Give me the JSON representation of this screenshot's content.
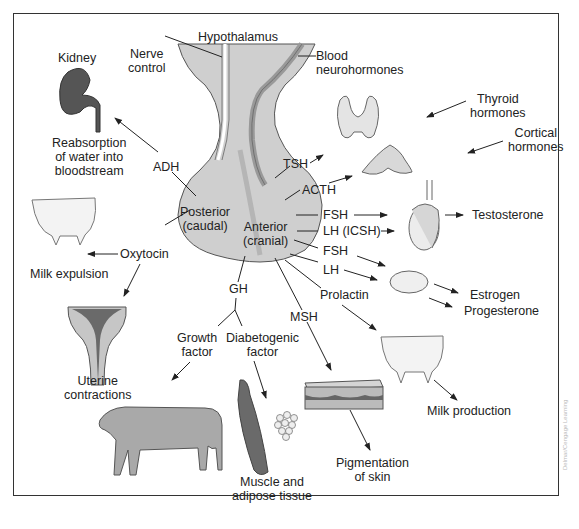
{
  "diagram": {
    "gland_regions": {
      "hypothalamus": "Hypothalamus",
      "nerve_control": [
        "Nerve",
        "control"
      ],
      "blood_neurohormones": [
        "Blood",
        "neurohormones"
      ],
      "posterior": [
        "Posterior",
        "(caudal)"
      ],
      "anterior": [
        "Anterior",
        "(cranial)"
      ]
    },
    "hormones": {
      "adh": "ADH",
      "oxytocin": "Oxytocin",
      "tsh": "TSH",
      "acth": "ACTH",
      "fsh_male": "FSH",
      "lh_icsh": "LH (ICSH)",
      "fsh_female": "FSH",
      "lh_female": "LH",
      "prolactin": "Prolactin",
      "msh": "MSH",
      "gh": "GH"
    },
    "targets": {
      "kidney": "Kidney",
      "reabsorption": [
        "Reabsorption",
        "of water into",
        "bloodstream"
      ],
      "milk_expulsion": "Milk expulsion",
      "uterine": [
        "Uterine",
        "contractions"
      ],
      "thyroid_hormones": [
        "Thyroid",
        "hormones"
      ],
      "cortical_hormones": [
        "Cortical",
        "hormones"
      ],
      "testosterone": "Testosterone",
      "estrogen": "Estrogen",
      "progesterone": "Progesterone",
      "milk_production": "Milk production",
      "pigmentation": [
        "Pigmentation",
        "of skin"
      ],
      "growth_factor": [
        "Growth",
        "factor"
      ],
      "diabetogenic_factor": [
        "Diabetogenic",
        "factor"
      ],
      "muscle_adipose": [
        "Muscle and",
        "adipose tissue"
      ]
    },
    "credit": "Delmar/Cengage Learning",
    "colors": {
      "gland_fill": "#c9c9c9",
      "gland_light": "#dcdcdc",
      "organ_fill": "#e6e6e6",
      "kidney_fill": "#555555",
      "muscle_fill": "#6a6a6a",
      "line": "#222222",
      "frame": "#333333"
    }
  }
}
